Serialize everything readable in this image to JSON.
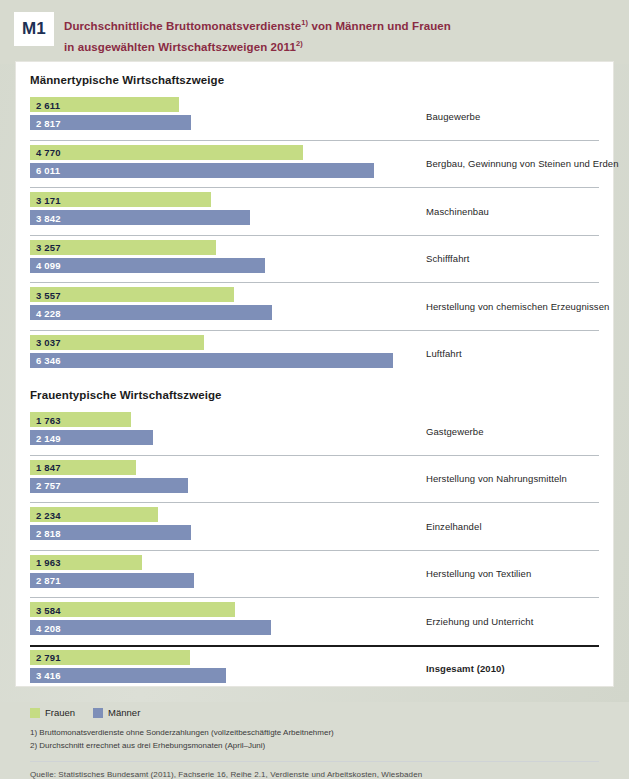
{
  "header": {
    "badge": "M1",
    "title_line1_a": "Durchschnittliche Bruttomonatsverdienste",
    "title_sup1": "1)",
    "title_line1_b": " von Männern und Frauen",
    "title_line2_a": "in ausgewählten Wirtschaftszweigen 2011",
    "title_sup2": "2)"
  },
  "sections": {
    "male_heading": "Männertypische Wirtschaftszweige",
    "female_heading": "Frauentypische Wirtschaftszweige"
  },
  "legend": {
    "frauen": "Frauen",
    "maenner": "Männer"
  },
  "notes": {
    "note1": "1) Bruttomonatsverdienste ohne Sonderzahlungen (vollzeitbeschäftigte Arbeitnehmer)",
    "note2": "2) Durchschnitt errechnet aus drei Erhebungsmonaten (April–Juni)"
  },
  "source": "Quelle: Statistisches Bundesamt (2011), Fachserie 16, Reihe 2.1, Verdienste und Arbeitskosten, Wiesbaden",
  "colors": {
    "frauen": "#c5dc84",
    "maenner": "#7e8fb8",
    "title": "#8a2b43",
    "badge_text": "#1d3054",
    "page_bg": "#d7dacf"
  },
  "chart_data": {
    "type": "bar",
    "xlabel": "",
    "ylabel": "",
    "orientation": "horizontal",
    "grid": false,
    "legend_position": "bottom-left",
    "xlim": [
      0,
      6500
    ],
    "unit": "Euro pro Monat",
    "series": [
      {
        "name": "Frauen",
        "color": "#c5dc84",
        "values": [
          2611,
          4770,
          3171,
          3257,
          3557,
          3037,
          1763,
          1847,
          2234,
          1963,
          3584,
          2791
        ]
      },
      {
        "name": "Männer",
        "color": "#7e8fb8",
        "values": [
          2817,
          6011,
          3842,
          4099,
          4228,
          6346,
          2149,
          2757,
          2818,
          2871,
          4208,
          3416
        ]
      }
    ],
    "categories": [
      "Baugewerbe",
      "Bergbau, Gewinnung von Steinen und Erden",
      "Maschinenbau",
      "Schifffahrt",
      "Herstellung von chemischen Erzeugnissen",
      "Luftfahrt",
      "Gastgewerbe",
      "Herstellung von Nahrungsmitteln",
      "Einzelhandel",
      "Herstellung von Textilien",
      "Erziehung und Unterricht",
      "Insgesamt (2010)"
    ],
    "groups": [
      {
        "heading": "Männertypische Wirtschaftszweige",
        "rows": [
          {
            "category": "Baugewerbe",
            "frauen": 2611,
            "maenner": 2817,
            "frauen_label": "2 611",
            "maenner_label": "2 817"
          },
          {
            "category": "Bergbau, Gewinnung von Steinen und Erden",
            "frauen": 4770,
            "maenner": 6011,
            "frauen_label": "4 770",
            "maenner_label": "6 011"
          },
          {
            "category": "Maschinenbau",
            "frauen": 3171,
            "maenner": 3842,
            "frauen_label": "3 171",
            "maenner_label": "3 842"
          },
          {
            "category": "Schifffahrt",
            "frauen": 3257,
            "maenner": 4099,
            "frauen_label": "3 257",
            "maenner_label": "4 099"
          },
          {
            "category": "Herstellung von chemischen Erzeugnissen",
            "frauen": 3557,
            "maenner": 4228,
            "frauen_label": "3 557",
            "maenner_label": "4 228"
          },
          {
            "category": "Luftfahrt",
            "frauen": 3037,
            "maenner": 6346,
            "frauen_label": "3 037",
            "maenner_label": "6 346"
          }
        ]
      },
      {
        "heading": "Frauentypische Wirtschaftszweige",
        "rows": [
          {
            "category": "Gastgewerbe",
            "frauen": 1763,
            "maenner": 2149,
            "frauen_label": "1 763",
            "maenner_label": "2 149"
          },
          {
            "category": "Herstellung von Nahrungsmitteln",
            "frauen": 1847,
            "maenner": 2757,
            "frauen_label": "1 847",
            "maenner_label": "2 757"
          },
          {
            "category": "Einzelhandel",
            "frauen": 2234,
            "maenner": 2818,
            "frauen_label": "2 234",
            "maenner_label": "2 818"
          },
          {
            "category": "Herstellung von Textilien",
            "frauen": 1963,
            "maenner": 2871,
            "frauen_label": "1 963",
            "maenner_label": "2 871"
          },
          {
            "category": "Erziehung und Unterricht",
            "frauen": 3584,
            "maenner": 4208,
            "frauen_label": "3 584",
            "maenner_label": "4 208"
          }
        ]
      },
      {
        "heading": "",
        "total": true,
        "rows": [
          {
            "category": "Insgesamt (2010)",
            "frauen": 2791,
            "maenner": 3416,
            "frauen_label": "2 791",
            "maenner_label": "3 416"
          }
        ]
      }
    ]
  }
}
